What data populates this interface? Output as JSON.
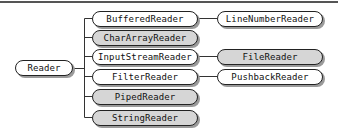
{
  "diagram": {
    "root": {
      "label": "Reader",
      "style": "plain"
    },
    "children": [
      {
        "label": "BufferedReader",
        "style": "plain",
        "child": {
          "label": "LineNumberReader",
          "style": "plain"
        }
      },
      {
        "label": "CharArrayReader",
        "style": "shaded"
      },
      {
        "label": "InputStreamReader",
        "style": "plain",
        "child": {
          "label": "FileReader",
          "style": "shaded"
        }
      },
      {
        "label": "FilterReader",
        "style": "plain",
        "child": {
          "label": "PushbackReader",
          "style": "plain"
        }
      },
      {
        "label": "PipedReader",
        "style": "shaded"
      },
      {
        "label": "StringReader",
        "style": "shaded"
      }
    ],
    "colors": {
      "node_plain": "#ffffff",
      "node_shaded": "#d6d6d6",
      "line": "#333333",
      "shadow": "#9a9a9a"
    }
  }
}
